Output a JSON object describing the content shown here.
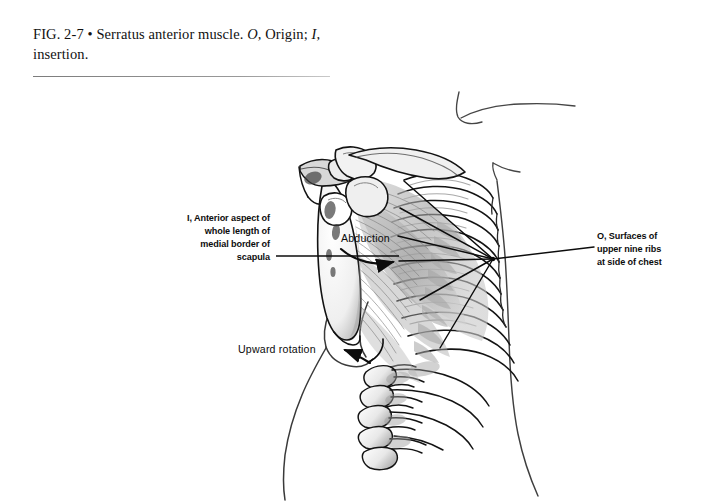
{
  "figure": {
    "caption_prefix": "FIG. 2-7",
    "caption_bullet": "•",
    "caption_title": "Serratus anterior muscle.",
    "caption_origin_key": "O,",
    "caption_origin_word": "Origin;",
    "caption_insertion_key": "I,",
    "caption_insertion_word": "insertion."
  },
  "annotations": {
    "insertion": "I, Anterior aspect of\nwhole length of\nmedial border of\nscapula",
    "origin": "O,  Surfaces of\n      upper nine ribs\n      at side of chest",
    "abduction": "Abduction",
    "upward_rotation": "Upward rotation"
  },
  "illustration": {
    "subject": "serratus-anterior-muscle-lateral-view",
    "structures": [
      "scapula",
      "acromion",
      "coracoid-process",
      "glenoid-fossa",
      "clavicle",
      "humerus-head",
      "rib-cage-upper-nine-ribs",
      "lumbar-vertebrae",
      "serratus-anterior-muscle-digitations",
      "body-contour-outline"
    ]
  },
  "colors": {
    "background": "#ffffff",
    "ink": "#111111",
    "muscle_gray": "#9a9a9a",
    "muscle_gray_light": "#c4c4c4",
    "bone_shadow": "#6e6e6e",
    "contour": "#3a3a3a",
    "rule": "#8c8c8c"
  }
}
